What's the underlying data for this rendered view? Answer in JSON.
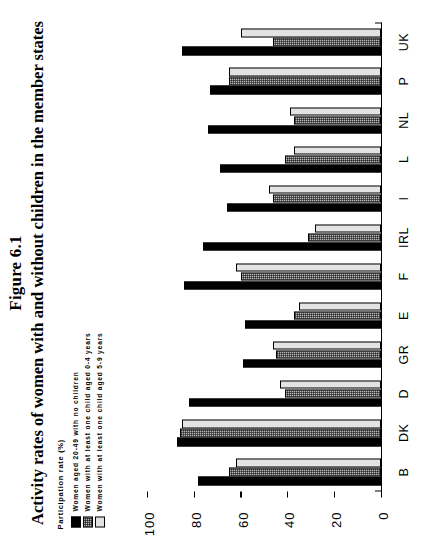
{
  "figure": {
    "number": "Figure 6.1",
    "title": "Activity rates of women with and without children in the member states",
    "axis_caption": "Participation rate (%)"
  },
  "legend": {
    "items": [
      {
        "key": "no_children",
        "label": "Women aged 20-49 with no children",
        "swatch": "black",
        "color": "#000000"
      },
      {
        "key": "child_0_4",
        "label": "Women with at least one child aged 0-4 years",
        "swatch": "dark-hatch",
        "color": "#b9b9b9"
      },
      {
        "key": "child_5_9",
        "label": "Women with at least one child aged 5-9 years",
        "swatch": "light",
        "color": "#e3e3e3"
      }
    ]
  },
  "axis": {
    "ticks": [
      "0",
      "20",
      "40",
      "60",
      "80",
      "100"
    ],
    "tick_values": [
      0,
      20,
      40,
      60,
      80,
      100
    ]
  },
  "chart_data": {
    "type": "bar",
    "title": "Activity rates of women with and without children in the member states",
    "subtitle": "Figure 6.1",
    "xlabel": "",
    "ylabel": "Participation rate (%)",
    "ylim": [
      0,
      100
    ],
    "grid": false,
    "orientation": "vertical-bars-on-rotated-page",
    "legend_position": "top-left",
    "categories": [
      "B",
      "DK",
      "D",
      "GR",
      "E",
      "F",
      "IRL",
      "I",
      "L",
      "NL",
      "P",
      "UK"
    ],
    "series": [
      {
        "name": "Women aged 20-49 with no children",
        "values": [
          78,
          87,
          82,
          59,
          58,
          84,
          76,
          66,
          69,
          74,
          73,
          85
        ]
      },
      {
        "name": "Women with at least one child aged 0-4 years",
        "values": [
          65,
          86,
          41,
          45,
          37,
          60,
          31,
          46,
          41,
          37,
          65,
          46
        ]
      },
      {
        "name": "Women with at least one child aged 5-9 years",
        "values": [
          62,
          85,
          43,
          46,
          35,
          62,
          28,
          48,
          37,
          39,
          65,
          60
        ]
      }
    ]
  }
}
